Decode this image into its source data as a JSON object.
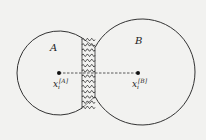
{
  "diagram": {
    "background": "#f2f2f0",
    "stroke_color": "#333333",
    "region_a": {
      "label": "A",
      "center": [
        59,
        73
      ],
      "radius": 42
    },
    "region_b": {
      "label": "B",
      "center": [
        142,
        72
      ],
      "radius": 53
    },
    "interface": {
      "type": "springs",
      "x_left": 82,
      "x_right": 95,
      "y_top": 37,
      "y_bottom": 110,
      "count": 14
    },
    "points": [
      {
        "id": "xA",
        "pos": [
          59,
          73
        ],
        "label_base": "x",
        "label_sub": "i",
        "label_sup": "[A]"
      },
      {
        "id": "xB",
        "pos": [
          138,
          73
        ],
        "label_base": "x",
        "label_sub": "i",
        "label_sup": "[B]"
      }
    ],
    "connector": {
      "style": "dashed",
      "from": "xA",
      "to": "xB"
    }
  }
}
